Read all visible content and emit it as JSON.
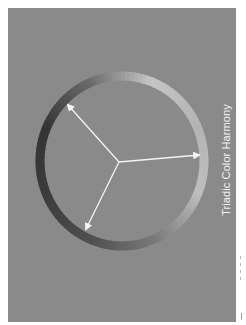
{
  "title": "Triadic Color Harmony",
  "diagram": {
    "type": "color-wheel",
    "harmony": "triadic",
    "arrow_count": 3,
    "colors": {
      "background": "#8a8a8a",
      "arrow": "#f4f4f4",
      "text": "#f2f2f2",
      "ring_stops": [
        "#c4c4c4",
        "#b4b4b4",
        "#bebebe",
        "#7a7a7a",
        "#505050",
        "#3c3c3c",
        "#343434",
        "#6a6a6a",
        "#c8c8c8"
      ]
    }
  }
}
